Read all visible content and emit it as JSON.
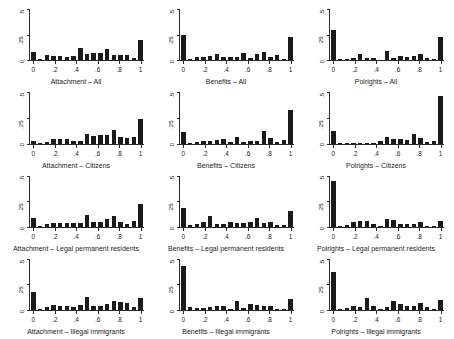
{
  "figure": {
    "type": "small-multiples-histogram-grid",
    "rows": 4,
    "cols": 3,
    "bar_color": "#1a1a1a",
    "axis_color": "#2b2b2b",
    "background": "#ffffff"
  },
  "axes": {
    "y_ticks": [
      "0",
      ".25",
      ".5"
    ],
    "y_tick_values": [
      0,
      0.25,
      0.5
    ],
    "ylim": [
      0,
      0.5
    ],
    "x_ticks": [
      "0",
      ".2",
      ".4",
      ".6",
      ".8",
      "1"
    ],
    "x_tick_values": [
      0,
      0.2,
      0.4,
      0.6,
      0.8,
      1
    ],
    "xlim": [
      -0.05,
      1.05
    ],
    "grid": false,
    "ylabel": "",
    "xlabel": ""
  },
  "chart_data": {
    "type": "bar",
    "title": "",
    "xlabel": "",
    "ylabel": "",
    "ylim": [
      0,
      0.5
    ],
    "xlim": [
      0,
      1
    ],
    "bin_centers": [
      0,
      0.0625,
      0.125,
      0.1875,
      0.25,
      0.3125,
      0.375,
      0.4375,
      0.5,
      0.5625,
      0.625,
      0.6875,
      0.75,
      0.8125,
      0.875,
      0.9375,
      1
    ],
    "panels": [
      {
        "title": "Attachment – All",
        "row": 1,
        "col": 1,
        "values": [
          0.085,
          0.01,
          0.052,
          0.043,
          0.043,
          0.035,
          0.038,
          0.12,
          0.062,
          0.072,
          0.072,
          0.115,
          0.055,
          0.055,
          0.05,
          0.022,
          0.2
        ]
      },
      {
        "title": "Benefits – All",
        "row": 1,
        "col": 2,
        "values": [
          0.248,
          0.012,
          0.028,
          0.03,
          0.04,
          0.062,
          0.03,
          0.035,
          0.03,
          0.072,
          0.022,
          0.06,
          0.082,
          0.028,
          0.048,
          0.012,
          0.228
        ]
      },
      {
        "title": "Polrights – All",
        "row": 1,
        "col": 3,
        "values": [
          0.305,
          0.008,
          0.015,
          0.025,
          0.062,
          0.018,
          0.022,
          0.006,
          0.092,
          0.018,
          0.04,
          0.032,
          0.04,
          0.062,
          0.02,
          0.01,
          0.232
        ]
      },
      {
        "title": "Attachment – Citizens",
        "row": 2,
        "col": 1,
        "values": [
          0.03,
          0.008,
          0.018,
          0.048,
          0.04,
          0.04,
          0.03,
          0.022,
          0.098,
          0.078,
          0.085,
          0.08,
          0.132,
          0.062,
          0.052,
          0.06,
          0.248
        ]
      },
      {
        "title": "Benefits – Citizens",
        "row": 2,
        "col": 2,
        "values": [
          0.11,
          0.01,
          0.018,
          0.022,
          0.03,
          0.038,
          0.048,
          0.02,
          0.062,
          0.012,
          0.03,
          0.025,
          0.128,
          0.058,
          0.012,
          0.035,
          0.33
        ]
      },
      {
        "title": "Polrights – Citizens",
        "row": 2,
        "col": 3,
        "values": [
          0.12,
          0.006,
          0.004,
          0.01,
          0.008,
          0.005,
          0.004,
          0.022,
          0.062,
          0.045,
          0.048,
          0.038,
          0.095,
          0.05,
          0.012,
          0.025,
          0.472
        ]
      },
      {
        "title": "Attachment – Legal permanent residents",
        "row": 3,
        "col": 1,
        "values": [
          0.085,
          0.012,
          0.028,
          0.042,
          0.038,
          0.038,
          0.035,
          0.042,
          0.118,
          0.052,
          0.052,
          0.078,
          0.112,
          0.048,
          0.03,
          0.058,
          0.225
        ]
      },
      {
        "title": "Benefits – Legal permanent residents",
        "row": 3,
        "col": 2,
        "values": [
          0.182,
          0.018,
          0.028,
          0.048,
          0.112,
          0.03,
          0.028,
          0.052,
          0.04,
          0.042,
          0.052,
          0.088,
          0.038,
          0.052,
          0.022,
          0.018,
          0.158
        ]
      },
      {
        "title": "Polrights – Legal permanent residents",
        "row": 3,
        "col": 3,
        "values": [
          0.458,
          0.01,
          0.022,
          0.052,
          0.055,
          0.058,
          0.03,
          0.008,
          0.082,
          0.072,
          0.03,
          0.028,
          0.032,
          0.048,
          0.006,
          0.005,
          0.062
        ]
      },
      {
        "title": "Attachment – Illegal immigrants",
        "row": 4,
        "col": 1,
        "values": [
          0.175,
          0.01,
          0.028,
          0.05,
          0.042,
          0.04,
          0.03,
          0.048,
          0.128,
          0.04,
          0.038,
          0.058,
          0.088,
          0.078,
          0.07,
          0.032,
          0.118
        ]
      },
      {
        "title": "Benefits – Illegal immigrants",
        "row": 4,
        "col": 2,
        "values": [
          0.44,
          0.03,
          0.022,
          0.022,
          0.03,
          0.04,
          0.042,
          0.012,
          0.09,
          0.018,
          0.062,
          0.05,
          0.042,
          0.038,
          0.012,
          0.01,
          0.11
        ]
      },
      {
        "title": "Polrights – Illegal immigrants",
        "row": 4,
        "col": 3,
        "values": [
          0.382,
          0.008,
          0.018,
          0.04,
          0.032,
          0.118,
          0.038,
          0.01,
          0.028,
          0.092,
          0.058,
          0.04,
          0.035,
          0.068,
          0.03,
          0.008,
          0.1
        ]
      }
    ]
  }
}
